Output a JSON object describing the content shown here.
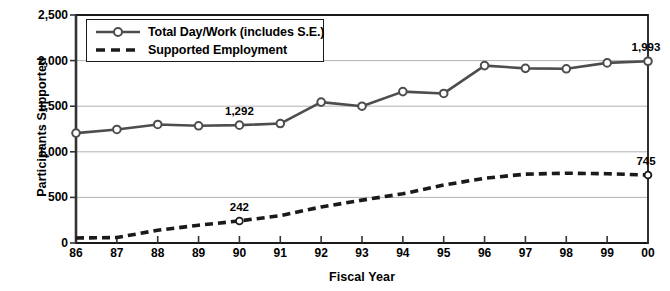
{
  "chart_data": {
    "type": "line",
    "title": "",
    "xlabel": "Fiscal Year",
    "ylabel": "Participants Supported",
    "categories": [
      "86",
      "87",
      "88",
      "89",
      "90",
      "91",
      "92",
      "93",
      "94",
      "95",
      "96",
      "97",
      "98",
      "99",
      "00"
    ],
    "ylim": [
      0,
      2500
    ],
    "yticks": [
      0,
      500,
      1000,
      1500,
      2000,
      2500
    ],
    "ytick_labels": [
      "0",
      "500",
      "1,000",
      "1,500",
      "2,000",
      "2,500"
    ],
    "grid": "horizontal",
    "legend_position": "top-left-inside",
    "series": [
      {
        "name": "Total Day/Work (includes S.E.)",
        "style": "solid-with-markers",
        "color": "#4d4d4d",
        "values": [
          1205,
          1245,
          1300,
          1285,
          1292,
          1310,
          1545,
          1500,
          1660,
          1640,
          1945,
          1915,
          1910,
          1975,
          1993
        ]
      },
      {
        "name": "Supported Employment",
        "style": "dashed",
        "color": "#1a1a1a",
        "values": [
          55,
          60,
          140,
          195,
          242,
          300,
          395,
          470,
          540,
          635,
          710,
          755,
          765,
          760,
          745
        ]
      }
    ],
    "annotations": [
      {
        "text": "1,292",
        "series": "Total Day/Work (includes S.E.)",
        "category": "90",
        "value": 1292
      },
      {
        "text": "1,993",
        "series": "Total Day/Work (includes S.E.)",
        "category": "00",
        "value": 1993
      },
      {
        "text": "242",
        "series": "Supported Employment",
        "category": "90",
        "value": 242
      },
      {
        "text": "745",
        "series": "Supported Employment",
        "category": "00",
        "value": 745
      }
    ]
  },
  "legend": {
    "items": [
      {
        "label": "Total Day/Work (includes S.E.)"
      },
      {
        "label": "Supported Employment"
      }
    ]
  },
  "axes": {
    "y_title": "Participants Supported",
    "x_title": "Fiscal Year"
  }
}
